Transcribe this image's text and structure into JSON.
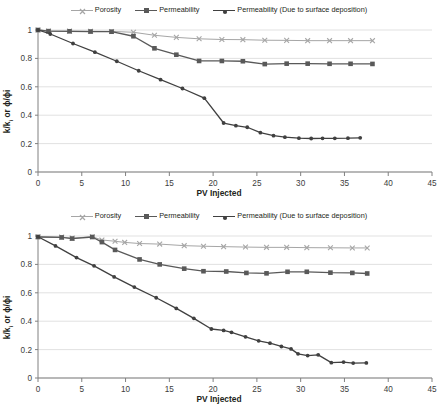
{
  "figure": {
    "panel_count": 2,
    "background": "#ffffff"
  },
  "colors": {
    "porosity": "#a6a6a6",
    "permeability": "#595959",
    "permeability_surface": "#404040",
    "grid": "#d9d9d9",
    "axis": "#808080",
    "text": "#231f20"
  },
  "legend": {
    "items": [
      {
        "label": "Porosity",
        "marker": "x-marker",
        "color": "#a6a6a6"
      },
      {
        "label": "Permeability",
        "marker": "square-marker",
        "color": "#595959"
      },
      {
        "label": "Permeability (Due to surface deposition)",
        "marker": "circle-marker",
        "color": "#404040"
      }
    ]
  },
  "axes": {
    "xlabel": "PV Injected",
    "ylabel_main": "k/k",
    "ylabel_sub": "i",
    "ylabel_rest": " or ϕ/ϕi",
    "ylabel_plain": "k/ki or ϕ/ϕi",
    "xticks": [
      "0",
      "5",
      "10",
      "15",
      "20",
      "25",
      "30",
      "35",
      "40",
      "45"
    ],
    "yticks": [
      "0",
      "0.2",
      "0.4",
      "0.6",
      "0.8",
      "1"
    ]
  },
  "chart_data": [
    {
      "type": "line",
      "panel": "top",
      "title": "",
      "xlabel": "PV Injected",
      "ylabel": "k/ki or ϕ/ϕi",
      "xlim": [
        0,
        45
      ],
      "ylim": [
        0,
        1
      ],
      "xticks": [
        0,
        5,
        10,
        15,
        20,
        25,
        30,
        35,
        40,
        45
      ],
      "yticks": [
        0,
        0.2,
        0.4,
        0.6,
        0.8,
        1
      ],
      "grid": "horizontal",
      "legend_position": "top-center",
      "series": [
        {
          "name": "Porosity",
          "marker": "x",
          "color": "#a6a6a6",
          "points": [
            [
              0.0,
              1.0
            ],
            [
              1.2,
              0.993
            ],
            [
              3.6,
              0.992
            ],
            [
              6.0,
              0.991
            ],
            [
              8.4,
              0.99
            ],
            [
              10.9,
              0.984
            ],
            [
              13.3,
              0.963
            ],
            [
              15.8,
              0.948
            ],
            [
              18.4,
              0.938
            ],
            [
              21.0,
              0.933
            ],
            [
              23.4,
              0.932
            ],
            [
              25.9,
              0.928
            ],
            [
              28.4,
              0.927
            ],
            [
              30.8,
              0.925
            ],
            [
              33.3,
              0.925
            ],
            [
              35.7,
              0.925
            ],
            [
              38.2,
              0.925
            ]
          ]
        },
        {
          "name": "Permeability",
          "marker": "square",
          "color": "#595959",
          "points": [
            [
              0.0,
              1.0
            ],
            [
              1.2,
              0.992
            ],
            [
              3.6,
              0.991
            ],
            [
              6.0,
              0.989
            ],
            [
              8.4,
              0.988
            ],
            [
              10.9,
              0.956
            ],
            [
              13.3,
              0.871
            ],
            [
              15.8,
              0.826
            ],
            [
              18.4,
              0.782
            ],
            [
              21.0,
              0.782
            ],
            [
              23.4,
              0.78
            ],
            [
              25.9,
              0.76
            ],
            [
              28.4,
              0.763
            ],
            [
              30.8,
              0.763
            ],
            [
              33.3,
              0.762
            ],
            [
              35.7,
              0.762
            ],
            [
              38.2,
              0.761
            ]
          ]
        },
        {
          "name": "Permeability (Due to surface deposition)",
          "marker": "circle",
          "color": "#404040",
          "points": [
            [
              0.0,
              1.0
            ],
            [
              1.4,
              0.972
            ],
            [
              4.0,
              0.905
            ],
            [
              6.5,
              0.844
            ],
            [
              9.0,
              0.78
            ],
            [
              11.5,
              0.713
            ],
            [
              14.0,
              0.65
            ],
            [
              16.5,
              0.588
            ],
            [
              19.0,
              0.52
            ],
            [
              21.2,
              0.345
            ],
            [
              22.6,
              0.326
            ],
            [
              23.9,
              0.315
            ],
            [
              25.4,
              0.277
            ],
            [
              26.9,
              0.256
            ],
            [
              28.2,
              0.245
            ],
            [
              29.8,
              0.238
            ],
            [
              31.2,
              0.236
            ],
            [
              32.5,
              0.237
            ],
            [
              33.9,
              0.237
            ],
            [
              35.4,
              0.238
            ],
            [
              36.8,
              0.241
            ]
          ]
        }
      ]
    },
    {
      "type": "line",
      "panel": "bottom",
      "title": "",
      "xlabel": "PV Injected",
      "ylabel": "k/ki or ϕ/ϕi",
      "xlim": [
        0,
        45
      ],
      "ylim": [
        0,
        1
      ],
      "xticks": [
        0,
        5,
        10,
        15,
        20,
        25,
        30,
        35,
        40,
        45
      ],
      "yticks": [
        0,
        0.2,
        0.4,
        0.6,
        0.8,
        1
      ],
      "grid": "horizontal",
      "legend_position": "top-center",
      "series": [
        {
          "name": "Porosity",
          "marker": "x",
          "color": "#a6a6a6",
          "points": [
            [
              0.0,
              0.995
            ],
            [
              2.7,
              0.992
            ],
            [
              3.9,
              0.985
            ],
            [
              6.2,
              0.995
            ],
            [
              7.3,
              0.972
            ],
            [
              8.8,
              0.963
            ],
            [
              9.9,
              0.955
            ],
            [
              11.6,
              0.947
            ],
            [
              13.9,
              0.943
            ],
            [
              16.7,
              0.932
            ],
            [
              18.9,
              0.928
            ],
            [
              21.2,
              0.925
            ],
            [
              23.7,
              0.922
            ],
            [
              26.1,
              0.92
            ],
            [
              28.4,
              0.92
            ],
            [
              30.7,
              0.918
            ],
            [
              33.4,
              0.917
            ],
            [
              35.9,
              0.916
            ],
            [
              37.6,
              0.916
            ]
          ]
        },
        {
          "name": "Permeability",
          "marker": "square",
          "color": "#595959",
          "points": [
            [
              0.0,
              0.993
            ],
            [
              2.7,
              0.99
            ],
            [
              3.9,
              0.982
            ],
            [
              6.2,
              0.993
            ],
            [
              7.3,
              0.957
            ],
            [
              8.8,
              0.902
            ],
            [
              11.6,
              0.835
            ],
            [
              13.9,
              0.8
            ],
            [
              16.7,
              0.77
            ],
            [
              18.9,
              0.752
            ],
            [
              21.5,
              0.75
            ],
            [
              23.8,
              0.74
            ],
            [
              26.1,
              0.737
            ],
            [
              28.5,
              0.748
            ],
            [
              30.7,
              0.748
            ],
            [
              33.4,
              0.742
            ],
            [
              35.9,
              0.74
            ],
            [
              37.6,
              0.736
            ]
          ]
        },
        {
          "name": "Permeability (Due to surface deposition)",
          "marker": "circle",
          "color": "#404040",
          "points": [
            [
              0.0,
              0.995
            ],
            [
              2.0,
              0.93
            ],
            [
              4.4,
              0.848
            ],
            [
              6.4,
              0.79
            ],
            [
              8.7,
              0.712
            ],
            [
              11.0,
              0.64
            ],
            [
              13.5,
              0.565
            ],
            [
              15.8,
              0.49
            ],
            [
              17.8,
              0.42
            ],
            [
              19.8,
              0.345
            ],
            [
              21.2,
              0.335
            ],
            [
              22.1,
              0.322
            ],
            [
              23.7,
              0.29
            ],
            [
              25.2,
              0.262
            ],
            [
              26.5,
              0.245
            ],
            [
              27.8,
              0.222
            ],
            [
              28.9,
              0.205
            ],
            [
              29.7,
              0.17
            ],
            [
              30.8,
              0.158
            ],
            [
              32.0,
              0.163
            ],
            [
              33.5,
              0.108
            ],
            [
              34.9,
              0.112
            ],
            [
              36.0,
              0.105
            ],
            [
              37.5,
              0.106
            ]
          ]
        }
      ]
    }
  ]
}
